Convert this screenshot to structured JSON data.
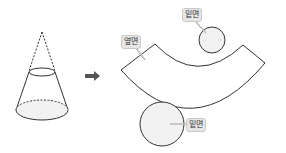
{
  "diagram": {
    "left_figure": "cone",
    "transform_arrow": "right-arrow",
    "labels": {
      "side_surface": "옆면",
      "top_base": "밑면",
      "bottom_base": "밑면"
    },
    "colors": {
      "stroke": "#333333",
      "fill_base": "#f2f2f2",
      "arrow": "#555555",
      "label_bg": "#e6e6e6",
      "leader": "#bbbbbb"
    }
  }
}
